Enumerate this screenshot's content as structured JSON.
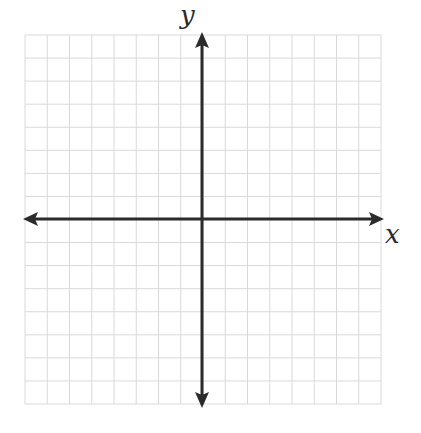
{
  "diagram": {
    "type": "coordinate-plane",
    "x_axis_label": "x",
    "y_axis_label": "y",
    "grid": {
      "x_min": -8,
      "x_max": 8,
      "y_min": -8,
      "y_max": 8,
      "step": 1,
      "visible": true
    },
    "colors": {
      "axis": "#2b2b2b",
      "grid": "#d9d9d9",
      "background": "#ffffff"
    }
  },
  "chart_data": {
    "type": "scatter",
    "title": "",
    "xlabel": "x",
    "ylabel": "y",
    "xlim": [
      -8,
      8
    ],
    "ylim": [
      -8,
      8
    ],
    "grid": true,
    "series": []
  }
}
